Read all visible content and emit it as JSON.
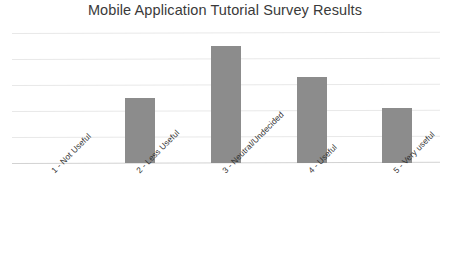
{
  "chart_data": {
    "type": "bar",
    "title": "Mobile Application Tutorial Survey Results",
    "xlabel": "",
    "ylabel": "",
    "categories": [
      "1 - Not Useful",
      "2 - Less Useful",
      "3 - Neutral/Undecided",
      "4 - Useful",
      "5 - Very useful"
    ],
    "values": [
      0,
      2.5,
      4.5,
      3.3,
      2.1
    ],
    "ylim": [
      0,
      5.2
    ],
    "yticks": [
      0,
      1,
      2,
      3,
      4,
      5
    ],
    "ytick_labels": [
      "",
      "",
      "",
      "",
      "",
      ""
    ],
    "grid": true,
    "grid_axis": "y",
    "legend": false,
    "legend_position": "none",
    "series": [
      {
        "name": "Responses",
        "values": [
          0,
          2.5,
          4.5,
          3.3,
          2.1
        ]
      }
    ]
  },
  "style": {
    "bar_color": "#8c8c8c",
    "grid_color": "#e8e8e8",
    "axis_color": "#d2d2d2",
    "title_color": "#3a3a3a",
    "label_color": "#333333",
    "background": "#ffffff"
  }
}
